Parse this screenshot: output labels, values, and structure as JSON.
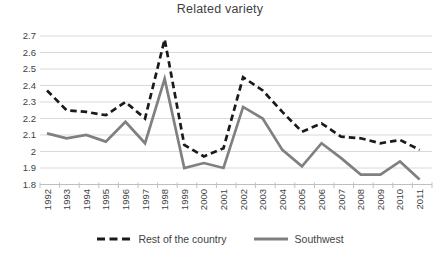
{
  "chart_data": {
    "type": "line",
    "title": "Related variety",
    "categories": [
      "1992",
      "1993",
      "1994",
      "1995",
      "1996",
      "1997",
      "1998",
      "1999",
      "2000",
      "2001",
      "2002",
      "2003",
      "2004",
      "2005",
      "2006",
      "2007",
      "2008",
      "2009",
      "2010",
      "2011"
    ],
    "series": [
      {
        "name": "Rest of the country",
        "style": "dashed",
        "color": "#1a1a1a",
        "values": [
          2.37,
          2.25,
          2.24,
          2.22,
          2.3,
          2.2,
          2.68,
          2.04,
          1.97,
          2.02,
          2.45,
          2.37,
          2.24,
          2.12,
          2.17,
          2.09,
          2.08,
          2.05,
          2.07,
          2.01
        ]
      },
      {
        "name": "Southwest",
        "style": "solid",
        "color": "#808080",
        "values": [
          2.11,
          2.08,
          2.1,
          2.06,
          2.18,
          2.05,
          2.44,
          1.9,
          1.93,
          1.9,
          2.27,
          2.2,
          2.01,
          1.91,
          2.05,
          1.96,
          1.86,
          1.86,
          1.94,
          1.83
        ]
      }
    ],
    "ylim": [
      1.8,
      2.7
    ],
    "ytick_step": 0.1,
    "ytick_labels": [
      "1.8",
      "1.9",
      "2",
      "2.1",
      "2.2",
      "2.3",
      "2.4",
      "2.5",
      "2.6",
      "2.7"
    ],
    "grid": true,
    "legend_position": "bottom",
    "colors": {
      "grid": "#d9d9d9",
      "axis": "#bfbfbf",
      "text": "#3f3f3f",
      "background": "#ffffff"
    }
  }
}
